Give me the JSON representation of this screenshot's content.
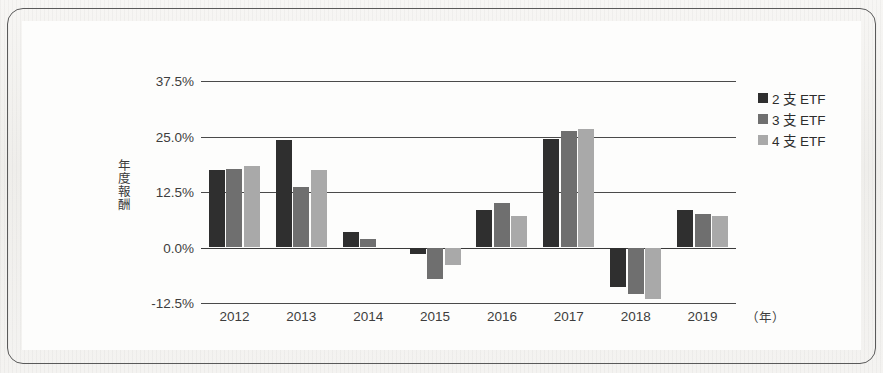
{
  "chart_data": {
    "type": "bar",
    "title": "",
    "subtitle": "",
    "xlabel": "（年）",
    "ylabel": "年度報酬",
    "categories": [
      "2012",
      "2013",
      "2014",
      "2015",
      "2016",
      "2017",
      "2018",
      "2019"
    ],
    "series": [
      {
        "name": "2 支 ETF",
        "color": "#2f2f2f",
        "values": [
          17.5,
          24.2,
          3.5,
          -1.5,
          8.5,
          24.5,
          -9.0,
          8.5
        ]
      },
      {
        "name": "3 支 ETF",
        "color": "#6f6f6f",
        "values": [
          17.6,
          13.6,
          2.0,
          -7.0,
          10.0,
          26.2,
          -10.5,
          7.5
        ]
      },
      {
        "name": "4 支 ETF",
        "color": "#a9a9a9",
        "values": [
          18.3,
          17.5,
          0.0,
          -4.0,
          7.0,
          26.6,
          -11.6,
          7.0
        ]
      }
    ],
    "ylim": [
      -12.5,
      37.5
    ],
    "yticks": [
      37.5,
      25.0,
      12.5,
      0.0,
      -12.5
    ],
    "ytick_labels": [
      "37.5%",
      "25.0%",
      "12.5%",
      "0.0%",
      "-12.5%"
    ],
    "grid": true,
    "grid_axis": "y",
    "legend_position": "top-right",
    "legend": [
      "2 支 ETF",
      "3 支 ETF",
      "4 支 ETF"
    ]
  }
}
